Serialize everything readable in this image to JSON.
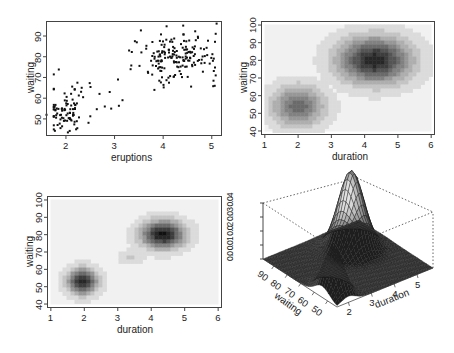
{
  "chart_data": [
    {
      "panel": "top-left",
      "type": "scatter",
      "title": "",
      "xlabel": "eruptions",
      "ylabel": "waiting",
      "xlim": [
        1.6,
        5.2
      ],
      "ylim": [
        42,
        97
      ],
      "xticks": [
        "2",
        "3",
        "4",
        "5"
      ],
      "yticks": [
        "50",
        "60",
        "70",
        "80",
        "90"
      ],
      "grid": false,
      "clusters": [
        {
          "name": "short eruptions",
          "center": [
            2.0,
            54
          ],
          "sd": [
            0.28,
            6
          ],
          "n": 95
        },
        {
          "name": "long eruptions",
          "center": [
            4.3,
            80
          ],
          "sd": [
            0.42,
            6
          ],
          "n": 175
        }
      ],
      "outliers": [
        [
          1.6,
          52
        ],
        [
          3.07,
          69
        ],
        [
          2.9,
          63
        ],
        [
          2.8,
          56
        ],
        [
          2.93,
          55
        ],
        [
          3.82,
          64
        ],
        [
          5.1,
          96
        ],
        [
          3.33,
          74
        ],
        [
          3.3,
          83
        ]
      ]
    },
    {
      "panel": "top-right",
      "type": "heatmap",
      "title": "",
      "xlabel": "duration",
      "ylabel": "waiting",
      "xlim": [
        0.9,
        6.1
      ],
      "ylim": [
        38,
        102
      ],
      "xticks": [
        "1",
        "2",
        "3",
        "4",
        "5",
        "6"
      ],
      "yticks": [
        "40",
        "50",
        "60",
        "70",
        "80",
        "90",
        "100"
      ],
      "colormap": "grey (white to black)",
      "modes": [
        {
          "center": [
            2.0,
            54
          ],
          "spread": [
            0.55,
            8
          ],
          "peak_darkness": 0.62
        },
        {
          "center": [
            4.3,
            80
          ],
          "spread": [
            0.75,
            9
          ],
          "peak_darkness": 0.92
        }
      ]
    },
    {
      "panel": "bottom-left",
      "type": "heatmap",
      "title": "",
      "xlabel": "duration",
      "ylabel": "waiting",
      "xlim": [
        0.9,
        6.1
      ],
      "ylim": [
        38,
        102
      ],
      "xticks": [
        "1",
        "2",
        "3",
        "4",
        "5",
        "6"
      ],
      "yticks": [
        "40",
        "50",
        "60",
        "70",
        "80",
        "90",
        "100"
      ],
      "colormap": "grey (white to black)",
      "modes": [
        {
          "center": [
            1.95,
            53
          ],
          "spread": [
            0.3,
            5
          ],
          "peak_darkness": 0.95
        },
        {
          "center": [
            4.35,
            80
          ],
          "spread": [
            0.45,
            5.5
          ],
          "peak_darkness": 0.98
        },
        {
          "center": [
            3.4,
            67
          ],
          "spread": [
            0.25,
            3
          ],
          "peak_darkness": 0.18
        }
      ]
    },
    {
      "panel": "bottom-right",
      "type": "surface",
      "title": "",
      "xlabel": "duration",
      "ylabel": "waiting",
      "zlabel": "",
      "xticks": [
        "2",
        "3",
        "4",
        "5"
      ],
      "yticks": [
        "90",
        "80",
        "70",
        "60",
        "50"
      ],
      "zticks": [
        "0.0",
        "0.01",
        "0.02",
        "0.03",
        "0.04"
      ],
      "zlim": [
        0,
        0.04
      ],
      "peaks": [
        {
          "duration": 4.3,
          "waiting": 80,
          "density": 0.036
        },
        {
          "duration": 2.0,
          "waiting": 54,
          "density": 0.021
        }
      ]
    }
  ],
  "labels": {
    "p1": {
      "x": "eruptions",
      "y": "waiting",
      "xt": [
        "2",
        "3",
        "4",
        "5"
      ],
      "yt": [
        "50",
        "60",
        "70",
        "80",
        "90"
      ]
    },
    "p2": {
      "x": "duration",
      "y": "waiting",
      "xt": [
        "1",
        "2",
        "3",
        "4",
        "5",
        "6"
      ],
      "yt": [
        "40",
        "50",
        "60",
        "70",
        "80",
        "90",
        "100"
      ]
    },
    "p3": {
      "x": "duration",
      "y": "waiting",
      "xt": [
        "1",
        "2",
        "3",
        "4",
        "5",
        "6"
      ],
      "yt": [
        "40",
        "50",
        "60",
        "70",
        "80",
        "90",
        "100"
      ]
    },
    "p4": {
      "x": "duration",
      "y": "waiting",
      "xt": [
        "2",
        "3",
        "4",
        "5"
      ],
      "yt": [
        "90",
        "80",
        "70",
        "60",
        "50"
      ],
      "zt": "0.0 0.01 0.02 0.03 0.04"
    }
  }
}
